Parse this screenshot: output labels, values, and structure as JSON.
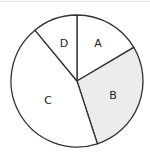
{
  "chart_data": {
    "type": "pie",
    "title": "",
    "categories": [
      "A",
      "B",
      "C",
      "D"
    ],
    "values": [
      16.5,
      28.5,
      44,
      11
    ],
    "unit": "percent (estimated from slice angles)",
    "start_angle": "12 o'clock",
    "direction": "clockwise",
    "legend": "none",
    "labels_inside_slices": true,
    "colors": {
      "A": "#ffffff",
      "B": "#ececec",
      "C": "#ffffff",
      "D": "#ffffff",
      "stroke": "#333333"
    }
  },
  "labels": {
    "a": "A",
    "b": "B",
    "c": "C",
    "d": "D"
  }
}
